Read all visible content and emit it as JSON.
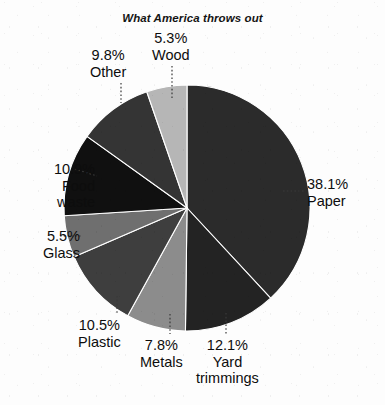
{
  "chart_data": {
    "type": "pie",
    "title": "What America throws out",
    "subtitle": "",
    "xlabel": "",
    "ylabel": "",
    "legend_position": "none",
    "grid": false,
    "units": "percent",
    "start_angle_deg": 0,
    "direction": "clockwise",
    "categories": [
      "Paper",
      "Yard trimmings",
      "Metals",
      "Plastic",
      "Glass",
      "Food waste",
      "Other",
      "Wood"
    ],
    "values": [
      38.1,
      12.1,
      7.8,
      10.5,
      5.5,
      10.9,
      9.8,
      5.3
    ],
    "slices": [
      {
        "name": "Paper",
        "value": 38.1,
        "pct_label": "38.1%",
        "color": "#2b2b2b",
        "label_side": "right"
      },
      {
        "name": "Yard trimmings",
        "value": 12.1,
        "pct_label": "12.1%",
        "color": "#232323",
        "label_side": "bottom"
      },
      {
        "name": "Metals",
        "value": 7.8,
        "pct_label": "7.8%",
        "color": "#8c8c8c",
        "label_side": "bottom"
      },
      {
        "name": "Plastic",
        "value": 10.5,
        "pct_label": "10.5%",
        "color": "#3e3e3e",
        "label_side": "bottom-left"
      },
      {
        "name": "Glass",
        "value": 5.5,
        "pct_label": "5.5%",
        "color": "#6f6f6f",
        "label_side": "left"
      },
      {
        "name": "Food waste",
        "value": 10.9,
        "pct_label": "10.9%",
        "color": "#101010",
        "label_side": "left"
      },
      {
        "name": "Other",
        "value": 9.8,
        "pct_label": "9.8%",
        "color": "#343434",
        "label_side": "top-left"
      },
      {
        "name": "Wood",
        "value": 5.3,
        "pct_label": "5.3%",
        "color": "#b6b6b6",
        "label_side": "top"
      }
    ]
  },
  "labels": {
    "paper": {
      "pct": "38.1%",
      "name": "Paper"
    },
    "yard": {
      "pct": "12.1%",
      "name": "Yard",
      "name2": "trimmings"
    },
    "metals": {
      "pct": "7.8%",
      "name": "Metals"
    },
    "plastic": {
      "pct": "10.5%",
      "name": "Plastic"
    },
    "glass": {
      "pct": "5.5%",
      "name": "Glass"
    },
    "food_waste": {
      "pct": "10.9%",
      "name": "Food",
      "name2": "waste"
    },
    "other": {
      "pct": "9.8%",
      "name": "Other"
    },
    "wood": {
      "pct": "5.3%",
      "name": "Wood"
    }
  },
  "colors": {
    "background": "#fdfdfd",
    "text": "#0d0d0d",
    "leader_line": "#3a3a3a"
  }
}
